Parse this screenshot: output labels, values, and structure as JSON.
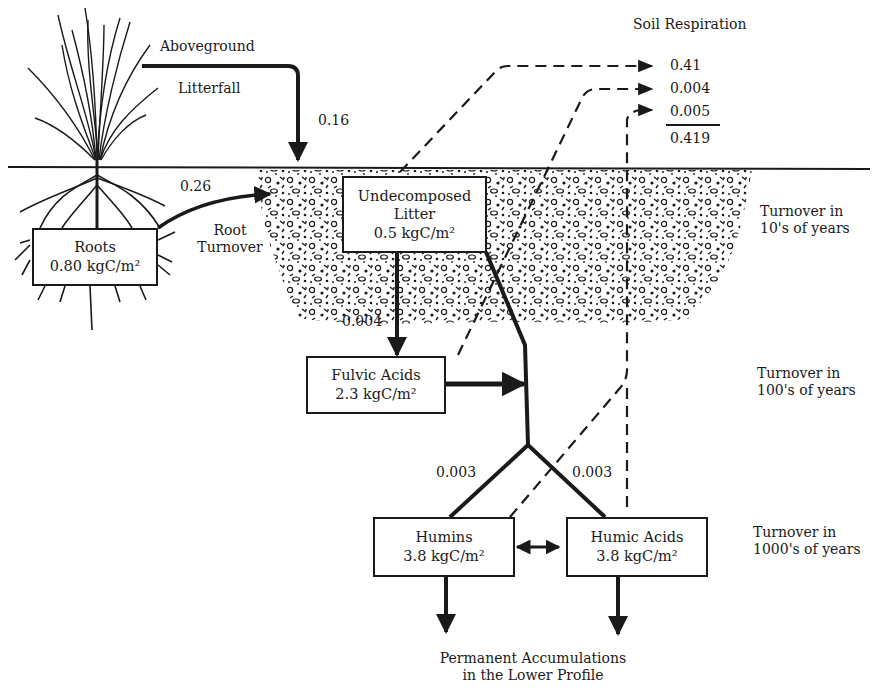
{
  "flows": {
    "aboveground_litterfall": {
      "label_line1": "Aboveground",
      "label_line2": "Litterfall",
      "value": "0.16"
    },
    "root_turnover": {
      "label_line1": "Root",
      "label_line2": "Turnover",
      "value": "0.26"
    },
    "litter_to_fulvic": {
      "value": "0.004"
    },
    "to_humins": {
      "value": "0.003"
    },
    "to_humic_acids": {
      "value": "0.003"
    }
  },
  "pools": {
    "roots": {
      "name": "Roots",
      "amount": "0.80 kgC/m²"
    },
    "undecomposed_litter": {
      "name_line1": "Undecomposed",
      "name_line2": "Litter",
      "amount": "0.5 kgC/m²"
    },
    "fulvic_acids": {
      "name": "Fulvic Acids",
      "amount": "2.3 kgC/m²"
    },
    "humins": {
      "name": "Humins",
      "amount": "3.8 kgC/m²"
    },
    "humic_acids": {
      "name": "Humic Acids",
      "amount": "3.8 kgC/m²"
    }
  },
  "soil_respiration": {
    "title": "Soil Respiration",
    "values": [
      "0.41",
      "0.004",
      "0.005"
    ],
    "total": "0.419"
  },
  "turnover": [
    {
      "line1": "Turnover in",
      "line2": "10's of years"
    },
    {
      "line1": "Turnover in",
      "line2": "100's of years"
    },
    {
      "line1": "Turnover in",
      "line2": "1000's of years"
    }
  ],
  "sink": {
    "line1": "Permanent Accumulations",
    "line2": "in the Lower Profile"
  },
  "colors": {
    "ink": "#1a1a1a",
    "paper": "#ffffff"
  }
}
